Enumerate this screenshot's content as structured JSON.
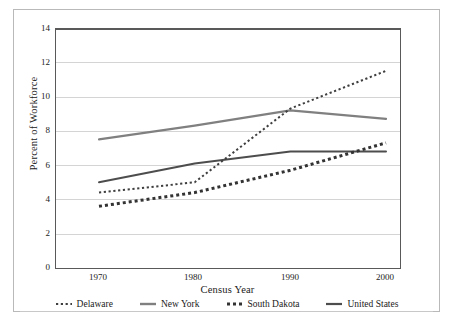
{
  "chart_data": {
    "type": "line",
    "title": "",
    "xlabel": "Census Year",
    "ylabel": "Percent of Workforce",
    "x": [
      1970,
      1980,
      1990,
      2000
    ],
    "xticklabels": [
      "1970",
      "1980",
      "1990",
      "2000"
    ],
    "yticklabels": [
      "0",
      "2",
      "4",
      "6",
      "8",
      "10",
      "12",
      "14"
    ],
    "yticks": [
      0,
      2,
      4,
      6,
      8,
      10,
      12,
      14
    ],
    "ylim": [
      0,
      14
    ],
    "xlim": [
      1970,
      2000
    ],
    "grid": "horizontal",
    "legend_position": "bottom",
    "series": [
      {
        "name": "Delaware",
        "values": [
          4.4,
          5.0,
          9.3,
          11.5
        ],
        "style": "dotted-fine",
        "color": "#3f3f3f",
        "width": 2.0
      },
      {
        "name": "New York",
        "values": [
          7.5,
          8.3,
          9.2,
          8.7
        ],
        "style": "solid",
        "color": "#808080",
        "width": 2.2
      },
      {
        "name": "South Dakota",
        "values": [
          3.6,
          4.4,
          5.7,
          7.3
        ],
        "style": "dotted-bold",
        "color": "#333333",
        "width": 2.8
      },
      {
        "name": "United States",
        "values": [
          5.0,
          6.1,
          6.8,
          6.8
        ],
        "style": "solid",
        "color": "#4d4d4d",
        "width": 2.0
      }
    ]
  },
  "legend": {
    "items": [
      {
        "label": "Delaware",
        "marker": "dotted-fine-swatch"
      },
      {
        "label": "New York",
        "marker": "solid-gray-swatch"
      },
      {
        "label": "South Dakota",
        "marker": "dotted-bold-swatch"
      },
      {
        "label": "United States",
        "marker": "solid-dark-swatch"
      }
    ]
  },
  "colors": {
    "grid": "#d4d4d4",
    "axis": "#595959",
    "frame": "#b9b9b9",
    "text": "#1a1a1a",
    "background": "#ffffff"
  }
}
